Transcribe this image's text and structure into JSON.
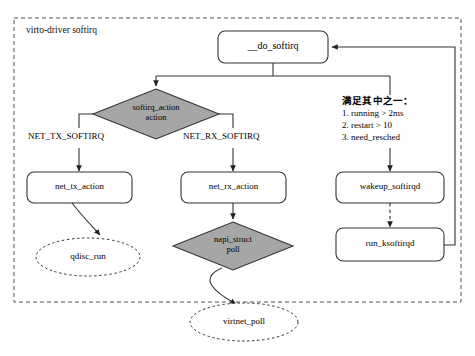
{
  "figure": {
    "type": "flowchart",
    "width": 475,
    "height": 356,
    "caption": ""
  },
  "group": {
    "title": "virto-driver softirq",
    "border_style": "dashed",
    "border_color": "#555555"
  },
  "colors": {
    "decision_fill": "#a6a6a6",
    "process_fill": "#ffffff",
    "stroke": "#333333",
    "text": "#000000"
  },
  "nodes": {
    "do_softirq": {
      "label": "__do_softirq",
      "shape": "rounded-rect"
    },
    "softirq_action": {
      "label": "softirq_action\naction",
      "shape": "diamond"
    },
    "net_tx_action": {
      "label": "net_tx_action",
      "shape": "rounded-rect"
    },
    "net_rx_action": {
      "label": "net_rx_action",
      "shape": "rounded-rect"
    },
    "wakeup_softirqd": {
      "label": "wakeup_softirqd",
      "shape": "rounded-rect"
    },
    "qdisc_run": {
      "label": "qdisc_run",
      "shape": "ellipse-dashed"
    },
    "napi_struct": {
      "label": "napi_struct\npoll",
      "shape": "diamond"
    },
    "run_ksoftirqd": {
      "label": "run_ksoftirqd",
      "shape": "rounded-rect"
    },
    "virtnet_poll": {
      "label": "virtnet_poll",
      "shape": "ellipse-dashed"
    }
  },
  "edge_labels": {
    "net_tx": "NET_TX_SOFTIRQ",
    "net_rx": "NET_RX_SOFTIRQ"
  },
  "condition": {
    "heading": "满足其中之一：",
    "items": [
      "1. running > 2ms",
      "2. restart > 10",
      "3. need_resched"
    ]
  }
}
